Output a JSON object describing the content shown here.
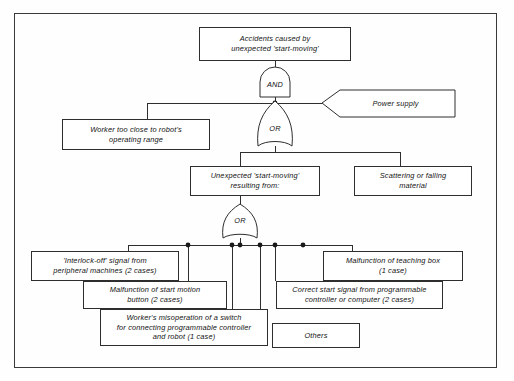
{
  "diagram": {
    "top_event": {
      "label": "Accidents caused by\nunexpected 'start-moving'",
      "line1": "Accidents caused by",
      "line2": "unexpected 'start-moving'"
    },
    "gates": [
      {
        "id": "gate-and-top",
        "type": "AND",
        "label": "AND"
      },
      {
        "id": "gate-or-mid",
        "type": "OR",
        "label": "OR"
      },
      {
        "id": "gate-or-bottom",
        "type": "OR",
        "label": "OR"
      }
    ],
    "events": {
      "power_supply": {
        "label": "Power supply",
        "shape": "house"
      },
      "worker_too_close": {
        "line1": "Worker too close to robot's",
        "line2": "operating range"
      },
      "unexpected_start_moving": {
        "line1": "Unexpected 'start-moving'",
        "line2": "resulting from:"
      },
      "scattering_material": {
        "line1": "Scattering or falling",
        "line2": "material"
      },
      "interlock_off": {
        "line1": "'Interlock-off' signal from",
        "line2": "peripheral machines (2 cases)",
        "cases": "2 cases"
      },
      "start_motion_button": {
        "line1": "Malfunction of start motion",
        "line2": "button (2 cases)",
        "cases": "2 cases"
      },
      "worker_misoperation": {
        "line1": "Worker's misoperation of a switch",
        "line2": "for connecting programmable controller",
        "line3": "and robot (1 case)",
        "cases": "1 case"
      },
      "teaching_box": {
        "line1": "Malfunction of teaching box",
        "line2": "(1 case)",
        "cases": "1 case"
      },
      "correct_start_signal": {
        "line1": "Correct start signal from programmable",
        "line2": "controller or computer (2 cases)",
        "cases": "2 cases"
      },
      "others": {
        "label": "Others"
      }
    },
    "colors": {
      "line": "#2e2e2e",
      "frame": "#3a3a3a",
      "text": "#121212",
      "background": "#fefefe"
    }
  }
}
